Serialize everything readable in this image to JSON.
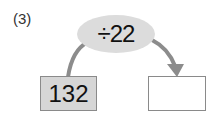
{
  "problem_label": "(3)",
  "operation": "÷22",
  "input_value": "132",
  "output_value": "",
  "colors": {
    "oval_fill": "#dcdcdc",
    "input_box_fill": "#d6d6d6",
    "box_border": "#8a8a8a",
    "arrow": "#8c8c8c"
  }
}
